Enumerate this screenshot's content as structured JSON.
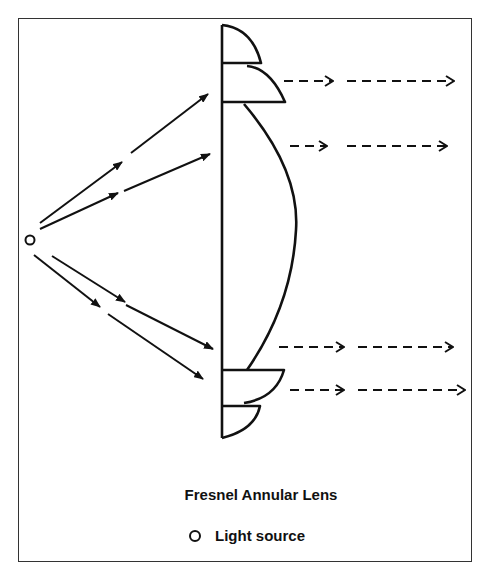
{
  "figure": {
    "title": "Fresnel Annular Lens",
    "legend": [
      {
        "symbol": "open-circle",
        "label": "Light source"
      }
    ]
  },
  "colors": {
    "stroke": "#111111",
    "frame": "#333333",
    "background": "#ffffff"
  },
  "diagram": {
    "light_source": {
      "x": 30,
      "y": 240
    },
    "incoming_rays": 4,
    "outgoing_rays": 4,
    "lens_segments": [
      "top-ring-1",
      "top-ring-2",
      "central-convex",
      "bottom-ring-1",
      "bottom-ring-2"
    ]
  }
}
